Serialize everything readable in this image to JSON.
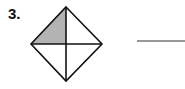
{
  "problem": {
    "number": "3.",
    "figure": {
      "shape": "diamond",
      "parts": 4,
      "shaded_parts": 1,
      "shaded_region": "top-left",
      "shade_color": "#b3b3b3",
      "stroke_color": "#111111"
    },
    "answer_blank": ""
  }
}
